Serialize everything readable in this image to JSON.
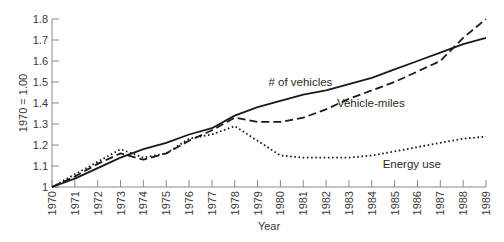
{
  "chart_data": {
    "type": "line",
    "title": "",
    "xlabel": "Year",
    "ylabel": "1970 = 1.00",
    "ylim": [
      1.0,
      1.8
    ],
    "grid": false,
    "legend_position": "inline labels",
    "x": [
      "1970",
      "1971",
      "1972",
      "1973",
      "1974",
      "1975",
      "1976",
      "1977",
      "1978",
      "1979",
      "1980",
      "1981",
      "1982",
      "1983",
      "1984",
      "1985",
      "1986",
      "1987",
      "1988",
      "1989"
    ],
    "y_ticks": [
      "1",
      "1.1",
      "1.2",
      "1.3",
      "1.4",
      "1.5",
      "1.6",
      "1.7",
      "1.8"
    ],
    "series": [
      {
        "name": "# of vehicles",
        "style": "solid",
        "values": [
          1.0,
          1.04,
          1.09,
          1.14,
          1.18,
          1.21,
          1.25,
          1.28,
          1.34,
          1.38,
          1.41,
          1.44,
          1.46,
          1.49,
          1.52,
          1.56,
          1.6,
          1.64,
          1.68,
          1.71
        ]
      },
      {
        "name": "Vehicle-miles",
        "style": "dashed",
        "values": [
          1.0,
          1.05,
          1.11,
          1.16,
          1.13,
          1.16,
          1.22,
          1.27,
          1.33,
          1.31,
          1.31,
          1.33,
          1.37,
          1.42,
          1.46,
          1.5,
          1.55,
          1.6,
          1.71,
          1.8
        ]
      },
      {
        "name": "Energy use",
        "style": "dotted",
        "values": [
          1.0,
          1.06,
          1.12,
          1.18,
          1.14,
          1.16,
          1.23,
          1.25,
          1.29,
          1.22,
          1.15,
          1.14,
          1.14,
          1.14,
          1.15,
          1.17,
          1.19,
          1.21,
          1.23,
          1.24
        ]
      }
    ],
    "annotations": [
      {
        "text": "# of vehicles",
        "x": "1980",
        "y": 1.48
      },
      {
        "text": "Vehicle-miles",
        "x": "1983",
        "y": 1.38
      },
      {
        "text": "Energy use",
        "x": "1985",
        "y": 1.09
      }
    ]
  }
}
